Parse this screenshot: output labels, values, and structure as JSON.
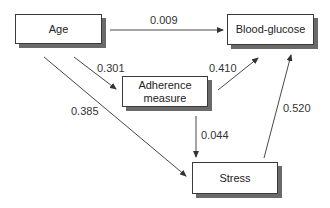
{
  "diagram": {
    "type": "path-diagram",
    "colors": {
      "box_border": "#3a3a3a",
      "box_shadow": "#6a6a6a",
      "arrow": "#333333",
      "text": "#222222",
      "background": "#ffffff"
    },
    "nodes": {
      "age": {
        "label": "Age"
      },
      "blood_glucose": {
        "label": "Blood-glucose"
      },
      "adherence": {
        "label_line1": "Adherence",
        "label_line2": "measure"
      },
      "stress": {
        "label": "Stress"
      }
    },
    "edges": {
      "age_to_blood_glucose": {
        "from": "Age",
        "to": "Blood-glucose",
        "coefficient": "0.009"
      },
      "age_to_adherence": {
        "from": "Age",
        "to": "Adherence measure",
        "coefficient": "0.301"
      },
      "age_to_stress": {
        "from": "Age",
        "to": "Stress",
        "coefficient": "0.385"
      },
      "adherence_to_blood_glucose": {
        "from": "Adherence measure",
        "to": "Blood-glucose",
        "coefficient": "0.410"
      },
      "adherence_to_stress": {
        "from": "Adherence measure",
        "to": "Stress",
        "coefficient": "0.044"
      },
      "stress_to_blood_glucose": {
        "from": "Stress",
        "to": "Blood-glucose",
        "coefficient": "0.520"
      }
    }
  }
}
